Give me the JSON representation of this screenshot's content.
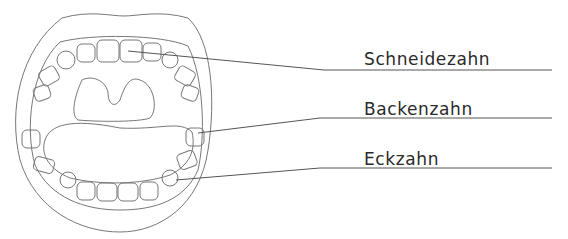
{
  "diagram": {
    "title": "",
    "labels": [
      {
        "id": "incisor",
        "text": "Schneidezahn",
        "x": 364,
        "y": 51
      },
      {
        "id": "molar",
        "text": "Backenzahn",
        "x": 364,
        "y": 101
      },
      {
        "id": "canine",
        "text": "Eckzahn",
        "x": 364,
        "y": 151
      }
    ],
    "colors": {
      "line": "#555555",
      "text": "#2a2a2a"
    }
  }
}
